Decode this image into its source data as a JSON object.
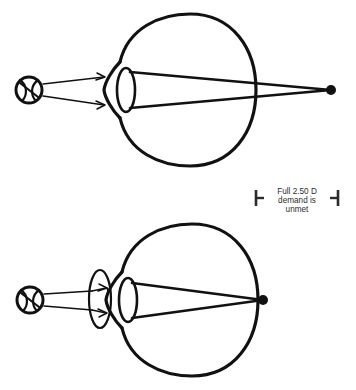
{
  "figure": {
    "background_color": "#ffffff",
    "ink_color": "#111111",
    "caption_color": "#2b2b2b",
    "width": 356,
    "height": 390
  },
  "annotation": {
    "line1": "Full 2.50 D",
    "line2": "demand is",
    "line3": "unmet",
    "left_bracket_name": "left-bracket-marker",
    "right_bracket_name": "right-bracket-marker"
  },
  "panels": [
    {
      "id": "top-panel",
      "name": "uncorrected-eye-panel",
      "object_label": "ball-object",
      "has_corrective_lens": false,
      "focus_location": "behind-retina",
      "focus_point": {
        "x": 331,
        "y": 90
      },
      "eye_center": {
        "x": 188,
        "y": 90
      },
      "eye_radius": 68
    },
    {
      "id": "bottom-panel",
      "name": "corrected-eye-panel",
      "object_label": "ball-object",
      "has_corrective_lens": true,
      "focus_location": "on-retina",
      "focus_point": {
        "x": 263,
        "y": 300
      },
      "eye_center": {
        "x": 190,
        "y": 300
      },
      "eye_radius": 68
    }
  ]
}
